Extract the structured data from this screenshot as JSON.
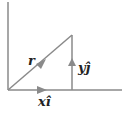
{
  "diagram": {
    "labels": {
      "r": "r",
      "y_component": "yĵ",
      "x_component": "xî"
    },
    "colors": {
      "line": "#8a8a8a",
      "text": "#222222"
    }
  }
}
